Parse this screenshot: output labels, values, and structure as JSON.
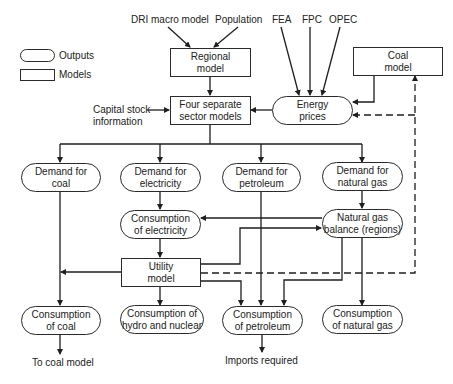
{
  "legend": {
    "outputs_label": "Outputs",
    "models_label": "Models"
  },
  "inputs": {
    "dri": "DRI macro model",
    "population": "Population",
    "fea": "FEA",
    "fpc": "FPC",
    "opec": "OPEC",
    "capital_stock_line1": "Capital stock",
    "capital_stock_line2": "information"
  },
  "models": {
    "regional": {
      "line1": "Regional",
      "line2": "model"
    },
    "sector": {
      "line1": "Four separate",
      "line2": "sector models"
    },
    "coal": {
      "line1": "Coal",
      "line2": "model"
    },
    "utility": {
      "line1": "Utility",
      "line2": "model"
    }
  },
  "outputs": {
    "energy_prices": {
      "line1": "Energy",
      "line2": "prices"
    },
    "demand_coal": {
      "line1": "Demand for",
      "line2": "coal"
    },
    "demand_electricity": {
      "line1": "Demand for",
      "line2": "electricity"
    },
    "demand_petroleum": {
      "line1": "Demand for",
      "line2": "petroleum"
    },
    "demand_natural_gas": {
      "line1": "Demand for",
      "line2": "natural gas"
    },
    "consumption_electricity": {
      "line1": "Consumption",
      "line2": "of electricity"
    },
    "natural_gas_balance": {
      "line1": "Natural gas",
      "line2": "balance (regions)"
    },
    "consumption_coal": {
      "line1": "Consumption",
      "line2": "of coal"
    },
    "consumption_hydro_nuclear": {
      "line1": "Consumption of",
      "line2": "hydro and nuclear"
    },
    "consumption_petroleum": {
      "line1": "Consumption",
      "line2": "of petroleum"
    },
    "consumption_natural_gas": {
      "line1": "Consumption",
      "line2": "of natural gas"
    }
  },
  "terminals": {
    "to_coal_model": "To coal model",
    "imports_required": "Imports required"
  },
  "colors": {
    "line": "#1e1e1e",
    "background": "#ffffff"
  }
}
